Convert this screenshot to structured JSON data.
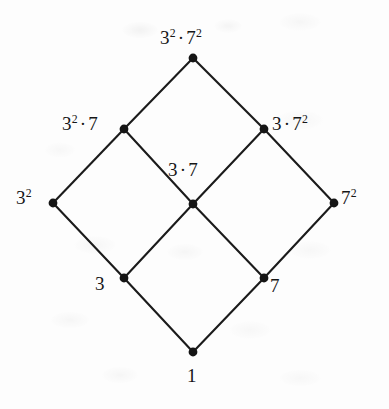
{
  "figure": {
    "kind": "hasse-diagram",
    "background_color": "#fdfdfd",
    "ink_color": "#1b1b1b",
    "width": 389,
    "height": 409
  },
  "nodes": [
    {
      "id": "top",
      "label_html": "3<sup>2</sup>&#183;7<sup>2</sup>",
      "label_text": "3^2 . 7^2",
      "x": 193,
      "y": 58,
      "label_x": 160,
      "label_y": 28,
      "label_align": "above"
    },
    {
      "id": "left-upper",
      "label_html": "3<sup>2</sup>&#183;7",
      "label_text": "3^2 . 7",
      "x": 124,
      "y": 129,
      "label_x": 62,
      "label_y": 114,
      "label_align": "left"
    },
    {
      "id": "right-upper",
      "label_html": "3&#183;7<sup>2</sup>",
      "label_text": "3 . 7^2",
      "x": 264,
      "y": 129,
      "label_x": 272,
      "label_y": 114,
      "label_align": "right"
    },
    {
      "id": "left",
      "label_html": "3<sup>2</sup>",
      "label_text": "3^2",
      "x": 53,
      "y": 203,
      "label_x": 16,
      "label_y": 188,
      "label_align": "left"
    },
    {
      "id": "center",
      "label_html": "3&#183;7",
      "label_text": "3 . 7",
      "x": 193,
      "y": 204,
      "label_x": 168,
      "label_y": 160,
      "label_align": "above-left"
    },
    {
      "id": "right",
      "label_html": "7<sup>2</sup>",
      "label_text": "7^2",
      "x": 334,
      "y": 203,
      "label_x": 341,
      "label_y": 188,
      "label_align": "right"
    },
    {
      "id": "left-lower",
      "label_html": "3",
      "label_text": "3",
      "x": 124,
      "y": 278,
      "label_x": 95,
      "label_y": 274,
      "label_align": "left-below"
    },
    {
      "id": "right-lower",
      "label_html": "7",
      "label_text": "7",
      "x": 264,
      "y": 278,
      "label_x": 270,
      "label_y": 276,
      "label_align": "right-below"
    },
    {
      "id": "bottom",
      "label_html": "1",
      "label_text": "1",
      "x": 193,
      "y": 352,
      "label_x": 187,
      "label_y": 366,
      "label_align": "below"
    }
  ],
  "edges": [
    {
      "from": "bottom",
      "to": "left-lower"
    },
    {
      "from": "bottom",
      "to": "right-lower"
    },
    {
      "from": "left-lower",
      "to": "left"
    },
    {
      "from": "left-lower",
      "to": "center"
    },
    {
      "from": "right-lower",
      "to": "center"
    },
    {
      "from": "right-lower",
      "to": "right"
    },
    {
      "from": "left",
      "to": "left-upper"
    },
    {
      "from": "center",
      "to": "left-upper"
    },
    {
      "from": "center",
      "to": "right-upper"
    },
    {
      "from": "right",
      "to": "right-upper"
    },
    {
      "from": "left-upper",
      "to": "top"
    },
    {
      "from": "right-upper",
      "to": "top"
    }
  ],
  "node_radius": 4.4
}
